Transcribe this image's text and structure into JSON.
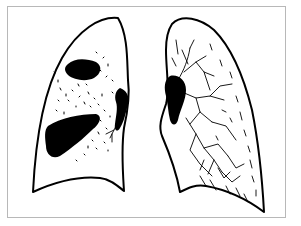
{
  "figure": {
    "colors": {
      "ink": "#000000",
      "background": "#ffffff",
      "frame": "#b8b8b8"
    },
    "panels": [
      {
        "id": "right-lung",
        "position": "image-left",
        "findings": [
          "upper-zone-opacity",
          "lower-zone-consolidation",
          "scattered-nodules",
          "hilar-shadow"
        ]
      },
      {
        "id": "left-lung",
        "position": "image-right",
        "findings": [
          "interstitial-branching-markings",
          "hilar-shadow",
          "basal-reticular-shading"
        ]
      }
    ]
  }
}
